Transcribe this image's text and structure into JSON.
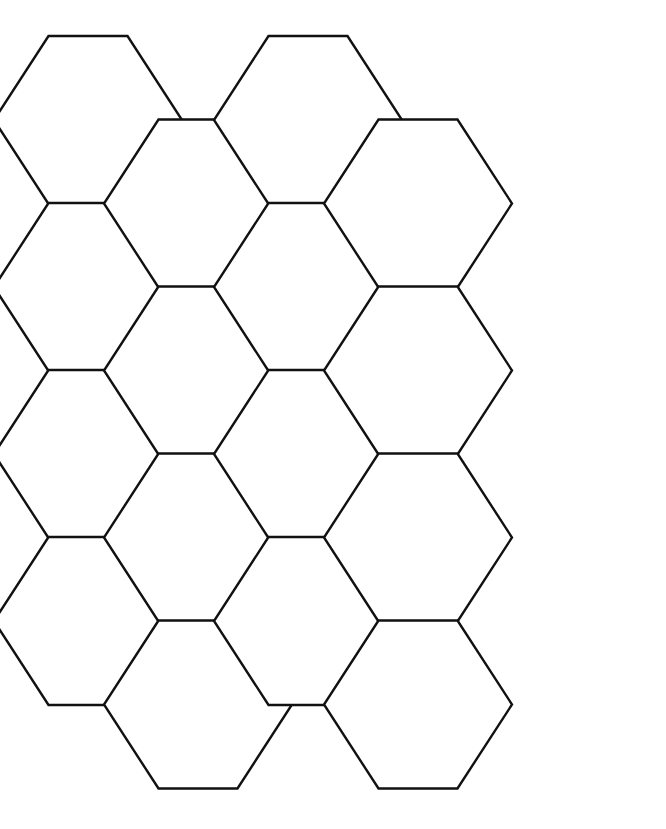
{
  "page": {
    "width": 666,
    "height": 829,
    "background_color": "#ffffff"
  },
  "figure": {
    "kind": "hexagon-tessellation",
    "orientation": "flat-top",
    "stroke_color": "#111111",
    "fill_color": "#ffffff",
    "stroke_width": 2.4,
    "hex_count": 16
  },
  "geometry": {
    "hex_width_vertex_to_vertex": 188,
    "hex_height_flat_to_flat": 168,
    "flat_top_edge_length": 79,
    "column_pitch": 110,
    "row_pitch": 167,
    "column_vertical_offset": 83.5,
    "origin_x": 17,
    "origin_y": 36,
    "columns": 4,
    "rows": 4
  },
  "hexagons": [
    {
      "id": "hex-c1-r1",
      "col": 1,
      "row": 1,
      "cx": 88,
      "cy": 120
    },
    {
      "id": "hex-c1-r2",
      "col": 1,
      "row": 2,
      "cx": 88,
      "cy": 287
    },
    {
      "id": "hex-c1-r3",
      "col": 1,
      "row": 3,
      "cx": 88,
      "cy": 454
    },
    {
      "id": "hex-c1-r4",
      "col": 1,
      "row": 4,
      "cx": 88,
      "cy": 621
    },
    {
      "id": "hex-c2-r1",
      "col": 2,
      "row": 1,
      "cx": 198,
      "cy": 203.5
    },
    {
      "id": "hex-c2-r2",
      "col": 2,
      "row": 2,
      "cx": 198,
      "cy": 370.5
    },
    {
      "id": "hex-c2-r3",
      "col": 2,
      "row": 3,
      "cx": 198,
      "cy": 537.5
    },
    {
      "id": "hex-c2-r4",
      "col": 2,
      "row": 4,
      "cx": 198,
      "cy": 704.5
    },
    {
      "id": "hex-c3-r1",
      "col": 3,
      "row": 1,
      "cx": 308,
      "cy": 120
    },
    {
      "id": "hex-c3-r2",
      "col": 3,
      "row": 2,
      "cx": 308,
      "cy": 287
    },
    {
      "id": "hex-c3-r3",
      "col": 3,
      "row": 3,
      "cx": 308,
      "cy": 454
    },
    {
      "id": "hex-c3-r4",
      "col": 3,
      "row": 4,
      "cx": 308,
      "cy": 621
    },
    {
      "id": "hex-c4-r1",
      "col": 4,
      "row": 1,
      "cx": 418,
      "cy": 203.5
    },
    {
      "id": "hex-c4-r2",
      "col": 4,
      "row": 2,
      "cx": 418,
      "cy": 370.5
    },
    {
      "id": "hex-c4-r3",
      "col": 4,
      "row": 3,
      "cx": 418,
      "cy": 537.5
    },
    {
      "id": "hex-c4-r4",
      "col": 4,
      "row": 4,
      "cx": 418,
      "cy": 704.5
    }
  ]
}
